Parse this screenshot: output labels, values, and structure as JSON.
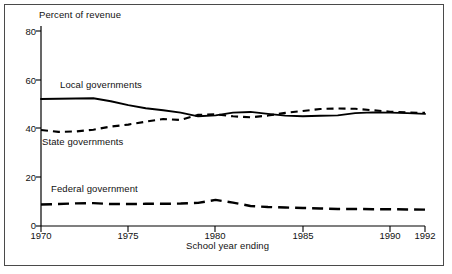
{
  "chart_data": {
    "type": "line",
    "title": "",
    "ylabel": "Percent of revenue",
    "xlabel": "School year ending",
    "ylim": [
      0,
      80
    ],
    "xlim": [
      1970,
      1992
    ],
    "yticks": [
      0,
      20,
      40,
      60,
      80
    ],
    "xticks": [
      1970,
      1975,
      1980,
      1985,
      1990,
      1992
    ],
    "xtick_labels": [
      "1970",
      "1975",
      "1980",
      "1985",
      "1990",
      "1992"
    ],
    "ytick_labels": [
      "0",
      "20",
      "40",
      "60",
      "80"
    ],
    "grid": false,
    "legend_position": "inline-annotations",
    "x": [
      1970,
      1971,
      1972,
      1973,
      1974,
      1975,
      1976,
      1977,
      1978,
      1979,
      1980,
      1981,
      1982,
      1983,
      1984,
      1985,
      1986,
      1987,
      1988,
      1989,
      1990,
      1991,
      1992
    ],
    "series": [
      {
        "name": "Local governments",
        "style": "solid",
        "color": "#000000",
        "values": [
          52.1,
          52.2,
          52.3,
          52.4,
          51.2,
          49.6,
          48.3,
          47.5,
          46.5,
          45.0,
          45.4,
          46.5,
          46.8,
          46.0,
          45.3,
          45.0,
          45.2,
          45.4,
          46.3,
          46.6,
          46.5,
          46.3,
          46.0
        ]
      },
      {
        "name": "State governments",
        "style": "dashed",
        "color": "#000000",
        "values": [
          39.4,
          38.6,
          38.8,
          39.5,
          40.8,
          41.6,
          42.8,
          43.9,
          43.5,
          45.6,
          45.8,
          45.0,
          44.6,
          45.3,
          46.4,
          47.2,
          48.0,
          48.2,
          48.1,
          47.5,
          46.9,
          46.6,
          46.4
        ]
      },
      {
        "name": "Federal government",
        "style": "long-dashed",
        "color": "#000000",
        "values": [
          8.8,
          9.0,
          9.3,
          9.4,
          9.0,
          9.0,
          9.1,
          9.1,
          9.2,
          9.5,
          10.7,
          9.6,
          8.2,
          7.8,
          7.6,
          7.4,
          7.2,
          7.0,
          7.0,
          6.9,
          6.9,
          6.8,
          6.7
        ]
      }
    ]
  },
  "chart": {
    "ylabel": "Percent of revenue",
    "xlabel": "School year ending",
    "labels": {
      "local": "Local governments",
      "state": "State governments",
      "federal": "Federal government"
    }
  }
}
